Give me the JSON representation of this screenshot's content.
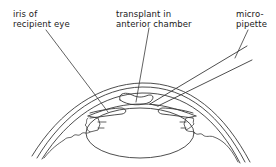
{
  "diagram": {
    "labels": {
      "iris": {
        "line1": "iris of",
        "line2": "recipient eye"
      },
      "transplant": {
        "line1": "transplant in",
        "line2": "anterior chamber"
      },
      "pipette": {
        "line1": "micro-",
        "line2": "pipette"
      }
    },
    "parts": [
      "cornea",
      "iris",
      "lens",
      "transplant",
      "micropipette",
      "ciliary body"
    ],
    "colors": {
      "line": "#3a3a3a",
      "text": "#1a1a1a",
      "background": "#ffffff"
    }
  }
}
